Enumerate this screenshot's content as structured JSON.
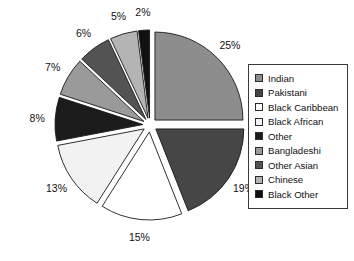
{
  "chart_data": {
    "type": "pie",
    "title": "",
    "legend_position": "right",
    "exploded": true,
    "start_angle_deg": 0,
    "direction": "clockwise",
    "categories": [
      "Indian",
      "Pakistani",
      "Black Caribbean",
      "Black African",
      "Other",
      "Bangladeshi",
      "Other Asian",
      "Chinese",
      "Black Other"
    ],
    "values": [
      25,
      19,
      15,
      13,
      8,
      7,
      6,
      5,
      2
    ],
    "value_unit": "%",
    "data_labels": [
      "25%",
      "19%",
      "15%",
      "13%",
      "8%",
      "7%",
      "6%",
      "5%",
      "2%"
    ],
    "colors": [
      "#8d8d8d",
      "#464646",
      "#ffffff",
      "#f2f2f2",
      "#1b1b1b",
      "#9a9a9a",
      "#535353",
      "#b4b4b4",
      "#111111"
    ]
  },
  "legend": {
    "items": [
      {
        "label": "Indian",
        "color": "#8d8d8d"
      },
      {
        "label": "Pakistani",
        "color": "#464646"
      },
      {
        "label": "Black Caribbean",
        "color": "#ffffff"
      },
      {
        "label": "Black African",
        "color": "#f2f2f2"
      },
      {
        "label": "Other",
        "color": "#1b1b1b"
      },
      {
        "label": "Bangladeshi",
        "color": "#9a9a9a"
      },
      {
        "label": "Other Asian",
        "color": "#535353"
      },
      {
        "label": "Chinese",
        "color": "#b4b4b4"
      },
      {
        "label": "Black Other",
        "color": "#111111"
      }
    ]
  }
}
